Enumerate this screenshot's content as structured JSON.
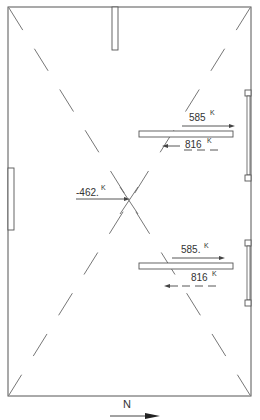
{
  "diagram": {
    "type": "structural load plan",
    "colors": {
      "line": "#555555",
      "background": "#ffffff"
    },
    "loads": [
      {
        "id": "upper-right-top",
        "value": "585",
        "unit": "K",
        "direction": "east",
        "style": "solid"
      },
      {
        "id": "upper-right-bottom",
        "value": "816",
        "unit": "K",
        "direction": "west",
        "style": "dashed"
      },
      {
        "id": "center",
        "value": "-462.",
        "unit": "K",
        "direction": "east",
        "style": "solid"
      },
      {
        "id": "lower-right-top",
        "value": "585.",
        "unit": "K",
        "direction": "east",
        "style": "solid"
      },
      {
        "id": "lower-right-bottom",
        "value": "816",
        "unit": "K",
        "direction": "west",
        "style": "dashed"
      }
    ],
    "north_arrow": {
      "label": "N",
      "direction": "east"
    }
  }
}
